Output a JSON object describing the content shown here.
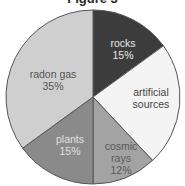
{
  "chart_data": {
    "type": "pie",
    "title": "Figure 3",
    "start_angle_deg": 0,
    "direction": "clockwise",
    "slices": [
      {
        "label": "rocks",
        "value": 15,
        "value_label": "15%",
        "color": "#3c3c3c",
        "text_color": "#e8e8e8"
      },
      {
        "label": "artificial sources",
        "value": 23,
        "value_label": "",
        "color": "#f4f4f4",
        "text_color": "#444444"
      },
      {
        "label": "cosmic rays",
        "value": 12,
        "value_label": "12%",
        "color": "#a3a3a3",
        "text_color": "#5a5a5a"
      },
      {
        "label": "plants",
        "value": 15,
        "value_label": "15%",
        "color": "#8a8a8a",
        "text_color": "#e0e0e0"
      },
      {
        "label": "radon gas",
        "value": 35,
        "value_label": "35%",
        "color": "#cfcfcf",
        "text_color": "#555555"
      }
    ]
  },
  "labels": {
    "title": "Figure 3",
    "rocks": "rocks",
    "rocks_pct": "15%",
    "artificial_1": "artificial",
    "artificial_2": "sources",
    "cosmic_1": "cosmic",
    "cosmic_2": "rays",
    "cosmic_pct": "12%",
    "plants": "plants",
    "plants_pct": "15%",
    "radon": "radon gas",
    "radon_pct": "35%"
  }
}
